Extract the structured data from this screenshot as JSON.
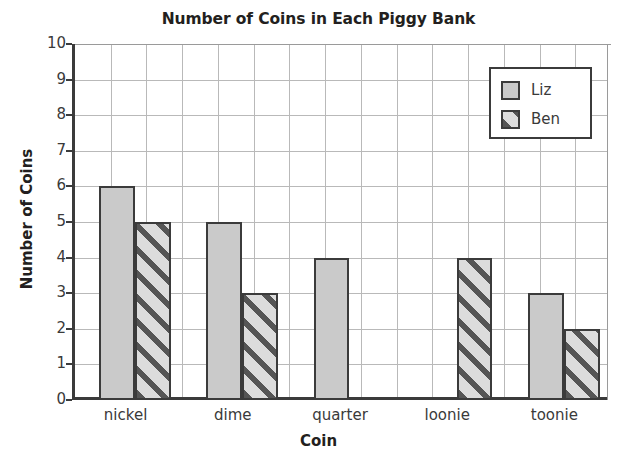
{
  "chart_data": {
    "type": "bar",
    "title": "Number of Coins in Each Piggy Bank",
    "xlabel": "Coin",
    "ylabel": "Number of Coins",
    "categories": [
      "nickel",
      "dime",
      "quarter",
      "loonie",
      "toonie"
    ],
    "series": [
      {
        "name": "Liz",
        "values": [
          6,
          5,
          4,
          0,
          3
        ],
        "fill": "solid",
        "color": "#cacaca"
      },
      {
        "name": "Ben",
        "values": [
          5,
          3,
          0,
          4,
          2
        ],
        "fill": "diagonal-hatch",
        "color": "#dcdcdc"
      }
    ],
    "ylim": [
      0,
      10
    ],
    "ytick_step": 1,
    "yticks": [
      "0",
      "1",
      "2",
      "3",
      "4",
      "5",
      "6",
      "7",
      "8",
      "9",
      "10"
    ],
    "grid": true,
    "legend_position": "top-right",
    "axis_color": "#3b3b3b",
    "grid_color": "#b9b9b9",
    "background": "#ffffff"
  },
  "legend": {
    "entries": [
      {
        "label": "Liz"
      },
      {
        "label": "Ben"
      }
    ]
  }
}
